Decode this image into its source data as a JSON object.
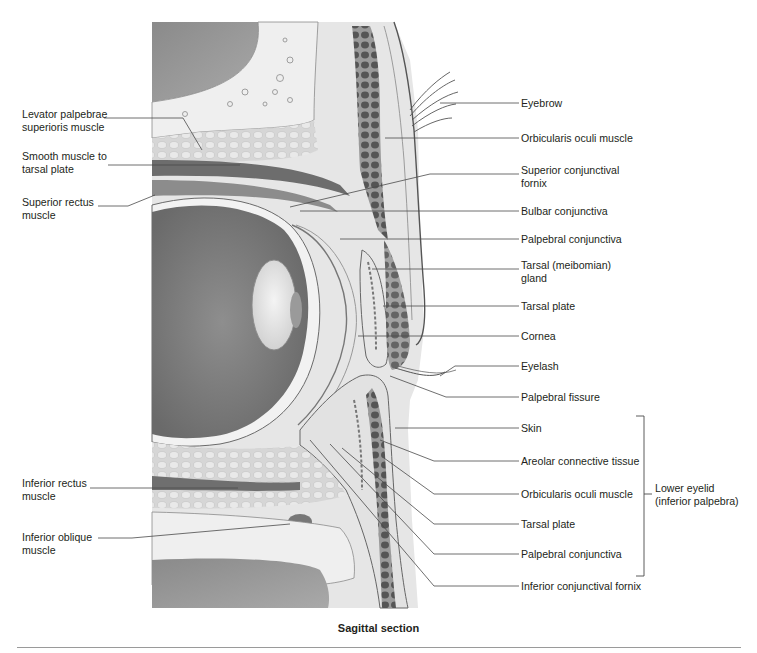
{
  "figure": {
    "caption": "Sagittal section",
    "left_labels": [
      {
        "id": "levator",
        "line1": "Levator palpebrae",
        "line2": "superioris muscle"
      },
      {
        "id": "smooth",
        "line1": "Smooth muscle to",
        "line2": "tarsal plate"
      },
      {
        "id": "sup_rectus",
        "line1": "Superior rectus",
        "line2": "muscle"
      },
      {
        "id": "inf_rectus",
        "line1": "Inferior rectus",
        "line2": "muscle"
      },
      {
        "id": "inf_oblique",
        "line1": "Inferior oblique",
        "line2": "muscle"
      }
    ],
    "right_labels": [
      {
        "id": "eyebrow",
        "line1": "Eyebrow",
        "line2": ""
      },
      {
        "id": "orbicularis_upper",
        "line1": "Orbicularis oculi muscle",
        "line2": ""
      },
      {
        "id": "sup_fornix",
        "line1": "Superior conjunctival",
        "line2": "fornix"
      },
      {
        "id": "bulbar",
        "line1": "Bulbar conjunctiva",
        "line2": ""
      },
      {
        "id": "palpebral_upper",
        "line1": "Palpebral conjunctiva",
        "line2": ""
      },
      {
        "id": "tarsal_gland",
        "line1": "Tarsal (meibomian)",
        "line2": "gland"
      },
      {
        "id": "tarsal_plate_upper",
        "line1": "Tarsal plate",
        "line2": ""
      },
      {
        "id": "cornea",
        "line1": "Cornea",
        "line2": ""
      },
      {
        "id": "eyelash",
        "line1": "Eyelash",
        "line2": ""
      },
      {
        "id": "fissure",
        "line1": "Palpebral fissure",
        "line2": ""
      },
      {
        "id": "skin",
        "line1": "Skin",
        "line2": ""
      },
      {
        "id": "areolar",
        "line1": "Areolar connective tissue",
        "line2": ""
      },
      {
        "id": "orbicularis_lower",
        "line1": "Orbicularis oculi muscle",
        "line2": ""
      },
      {
        "id": "tarsal_plate_lower",
        "line1": "Tarsal plate",
        "line2": ""
      },
      {
        "id": "palpebral_lower",
        "line1": "Palpebral conjunctiva",
        "line2": ""
      },
      {
        "id": "inf_fornix",
        "line1": "Inferior conjunctival fornix",
        "line2": ""
      }
    ],
    "bracket_label": {
      "line1": "Lower eyelid",
      "line2": "(inferior palpebra)"
    },
    "colors": {
      "text": "#231f20",
      "leader": "#4a4a4a",
      "sinus_dark": "#8f8f8f",
      "eyeball_inside": "#7d7d7d",
      "bone": "#ececec",
      "fat": "#d9d9d9",
      "muscle_dark": "#5e5e5e",
      "skin_light": "#e4e4e4"
    }
  }
}
